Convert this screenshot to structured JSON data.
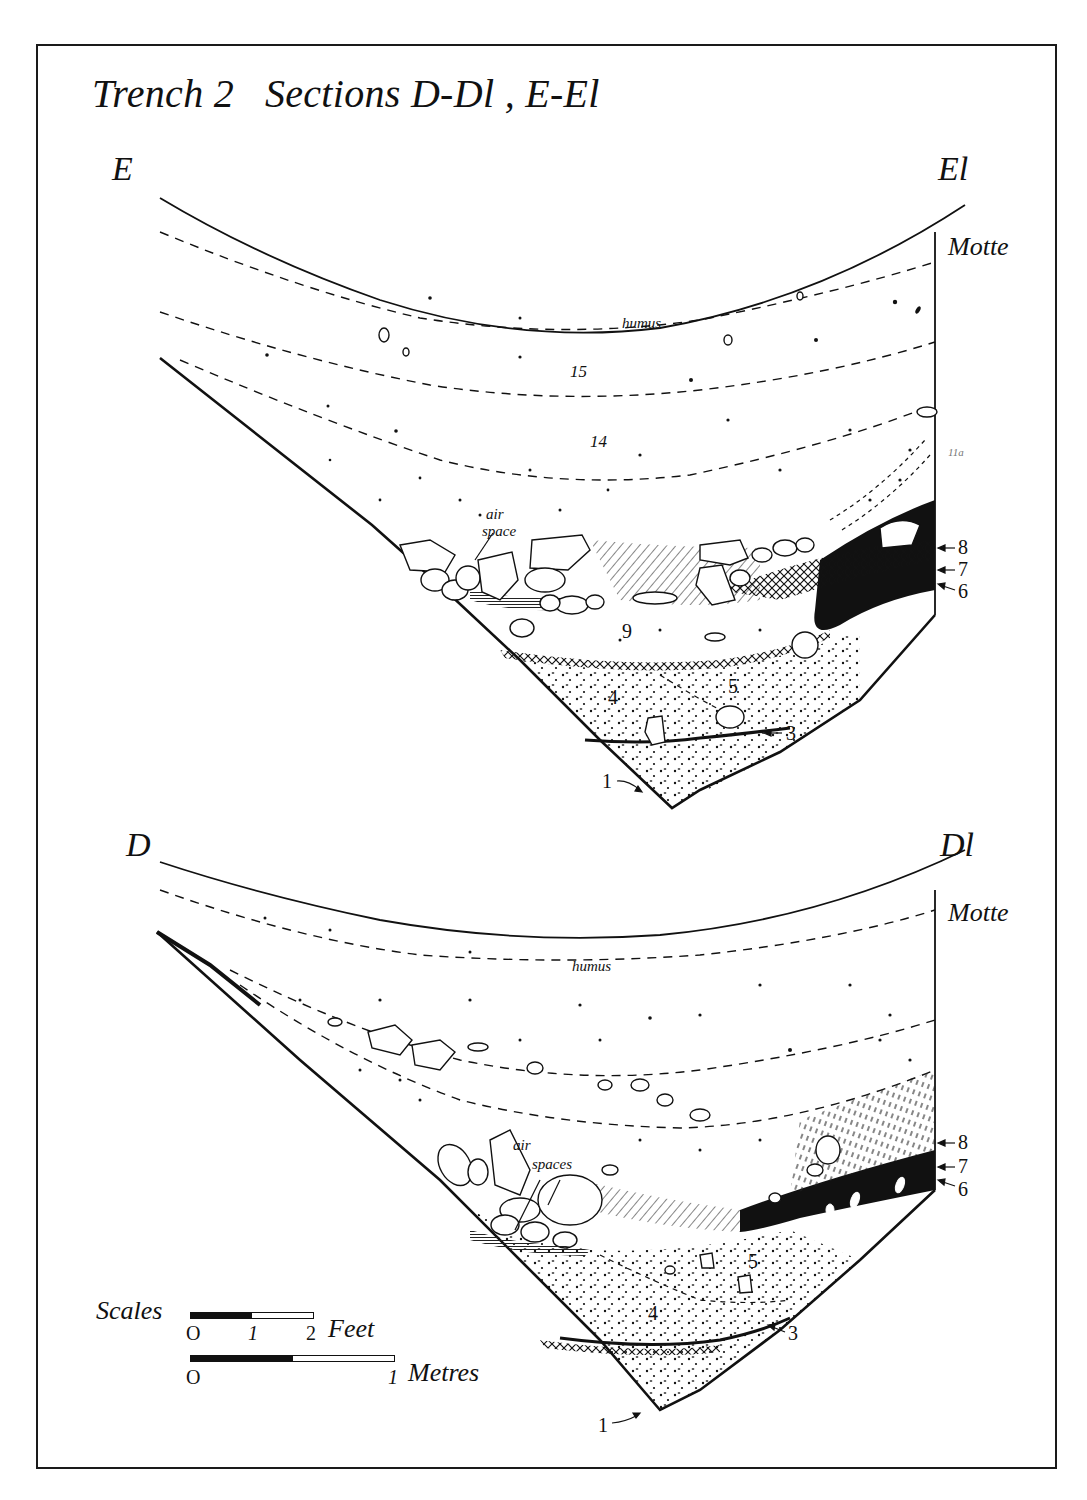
{
  "title": "Trench 2   Sections D-Dl , E-El",
  "section_upper": {
    "name": "E-El",
    "left_end": "E",
    "right_end": "El",
    "motte_label": "Motte",
    "layers": {
      "humus": "humus",
      "l15": "15",
      "l14": "14",
      "l11a": "11a",
      "air_space": "air space",
      "air": "air",
      "space": "space",
      "l9": "9",
      "l5": "5",
      "l4": "4"
    },
    "pointers": {
      "l8": "8",
      "l7": "7",
      "l6": "6",
      "l3": "3",
      "l1": "1"
    }
  },
  "section_lower": {
    "name": "D-Dl",
    "left_end": "D",
    "right_end": "Dl",
    "motte_label": "Motte",
    "layers": {
      "humus": "humus",
      "air": "air",
      "spaces": "spaces",
      "l5": "5",
      "l4": "4"
    },
    "pointers": {
      "l8": "8",
      "l7": "7",
      "l6": "6",
      "l3": "3",
      "l1": "1"
    }
  },
  "scales": {
    "label": "Scales",
    "feet": {
      "ticks": [
        "O",
        "1",
        "2"
      ],
      "unit": "Feet"
    },
    "metres": {
      "ticks": [
        "O",
        "1"
      ],
      "unit": "Metres"
    }
  },
  "colors": {
    "ink": "#111111",
    "paper": "#ffffff"
  }
}
